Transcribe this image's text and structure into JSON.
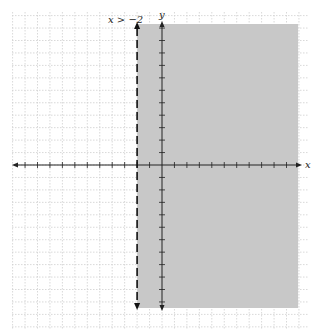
{
  "header_text": "graph of the inequality",
  "graph": {
    "inequality_label": "x > −2",
    "x_axis_label": "x",
    "y_axis_label": "y",
    "boundary": {
      "x": -2,
      "style": "dashed"
    },
    "shaded_side": "right",
    "colors": {
      "shade": "#c8c8c8",
      "grid": "#cfcfcf",
      "axis": "#222222",
      "boundary": "#111111"
    },
    "x_range": [
      -12,
      11
    ],
    "y_range": [
      -13,
      11
    ]
  }
}
